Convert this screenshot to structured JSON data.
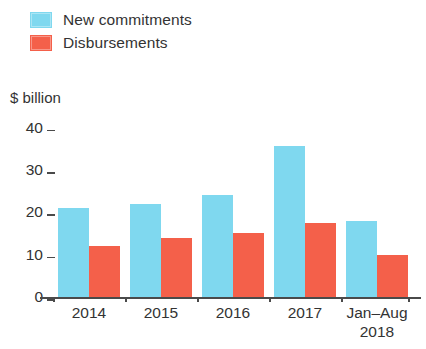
{
  "legend": {
    "items": [
      {
        "label": "New commitments",
        "color": "#7FD8EF",
        "swatch": "legend-swatch-new-commitments"
      },
      {
        "label": "Disbursements",
        "color": "#F4604A",
        "swatch": "legend-swatch-disbursements"
      }
    ]
  },
  "axis": {
    "y_unit": "$ billion",
    "y_ticks": [
      "40",
      "30",
      "20",
      "10",
      "0"
    ]
  },
  "chart_data": {
    "type": "bar",
    "title": "",
    "subtitle": "",
    "xlabel": "",
    "ylabel": "$ billion",
    "ylim": [
      0,
      40
    ],
    "yticks": [
      0,
      10,
      20,
      30,
      40
    ],
    "grid": false,
    "legend_position": "top-left",
    "categories": [
      "2014",
      "2015",
      "2016",
      "2017",
      "Jan–Aug 2018"
    ],
    "category_lines": [
      [
        "2014"
      ],
      [
        "2015"
      ],
      [
        "2016"
      ],
      [
        "2017"
      ],
      [
        "Jan–Aug",
        "2018"
      ]
    ],
    "series": [
      {
        "name": "New commitments",
        "color": "#7FD8EF",
        "values": [
          21,
          22,
          24,
          35.5,
          18
        ]
      },
      {
        "name": "Disbursements",
        "color": "#F4604A",
        "values": [
          12,
          14,
          15,
          17.5,
          10
        ]
      }
    ]
  },
  "colors": {
    "new_commitments": "#7FD8EF",
    "disbursements": "#F4604A",
    "axis": "#4a4a4a",
    "text": "#333333",
    "background": "#ffffff"
  }
}
